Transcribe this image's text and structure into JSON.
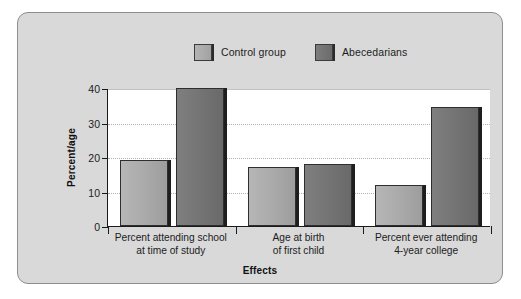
{
  "chart_data": {
    "type": "bar",
    "title": "",
    "xlabel": "Effects",
    "ylabel": "Percent/age",
    "ylim": [
      0,
      40
    ],
    "yticks": [
      0,
      10,
      20,
      30,
      40
    ],
    "ytick_labels": [
      "0",
      "10",
      "20",
      "30",
      "40"
    ],
    "grid": true,
    "legend_position": "top-center",
    "categories": [
      "Percent attending school at time of study",
      "Age at birth of first child",
      "Percent ever attending 4-year college"
    ],
    "category_lines": [
      [
        "Percent attending school",
        "at time of study"
      ],
      [
        "Age at birth",
        "of first child"
      ],
      [
        "Percent ever attending",
        "4-year college"
      ]
    ],
    "series": [
      {
        "name": "Control group",
        "color": "#a9a9a9",
        "values": [
          19,
          17,
          12
        ]
      },
      {
        "name": "Abecedarians",
        "color": "#737373",
        "values": [
          40,
          18,
          34.5
        ]
      }
    ]
  },
  "legend": {
    "items": [
      {
        "label": "Control group",
        "swatch": "legend-swatch-control"
      },
      {
        "label": "Abecedarians",
        "swatch": "legend-swatch-abecedarian"
      }
    ]
  },
  "axes": {
    "y_title": "Percent/age",
    "x_title": "Effects",
    "y_labels": [
      "0",
      "10",
      "20",
      "30",
      "40"
    ]
  },
  "colors": {
    "panel_background": "#d9d9d9",
    "panel_border": "#8e8e8e",
    "plot_background": "#ffffff",
    "axis": "#1a1a1a",
    "gridline": "#b0b0b0",
    "control_bar": "#a9a9a9",
    "abecedarian_bar": "#737373",
    "bar_outline": "#2e2e2e",
    "text": "#1c1c1c"
  }
}
